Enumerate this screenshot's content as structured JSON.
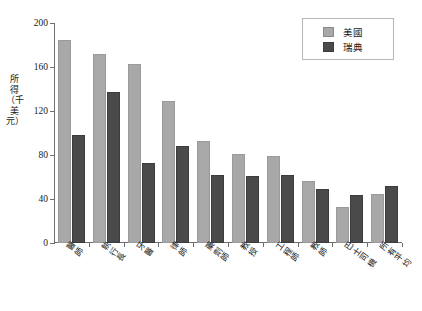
{
  "chart_data": {
    "type": "bar",
    "title": "",
    "xlabel": "",
    "ylabel": "所得（千美元）",
    "ylim": [
      0,
      200
    ],
    "yticks": [
      0,
      40,
      80,
      120,
      160,
      200
    ],
    "grid": false,
    "legend_position": "top-right",
    "categories": [
      "醫師",
      "執行長",
      "牙醫",
      "律師",
      "藥劑師",
      "教授",
      "工程師",
      "教師",
      "巴士司機",
      "所有平均"
    ],
    "series": [
      {
        "name": "美國",
        "color": "#a8a8a8",
        "values": [
          185,
          172,
          163,
          129,
          93,
          81,
          79,
          56,
          33,
          45
        ]
      },
      {
        "name": "瑞典",
        "color": "#4a4a4a",
        "values": [
          98,
          137,
          73,
          88,
          62,
          61,
          62,
          49,
          44,
          52
        ]
      }
    ]
  },
  "legend": {
    "items": [
      {
        "label": "美國",
        "swatch": "us"
      },
      {
        "label": "瑞典",
        "swatch": "se"
      }
    ]
  },
  "axis": {
    "y_title": "所得（千美元）",
    "y_tick_labels": [
      "200",
      "160",
      "120",
      "80",
      "40",
      "0"
    ]
  }
}
